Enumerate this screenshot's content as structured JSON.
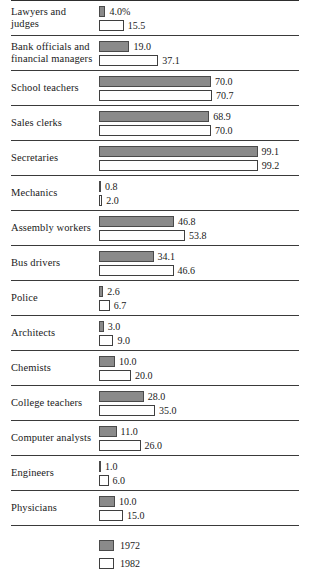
{
  "chart_data": {
    "type": "bar",
    "orientation": "horizontal",
    "title": "",
    "xlabel": "",
    "ylabel": "",
    "xlim": [
      0,
      100
    ],
    "grid": false,
    "legend_position": "bottom",
    "value_suffix_first": "%",
    "categories": [
      "Lawyers and judges",
      "Bank officials and financial managers",
      "School teachers",
      "Sales clerks",
      "Secretaries",
      "Mechanics",
      "Assembly workers",
      "Bus drivers",
      "Police",
      "Architects",
      "Chemists",
      "College teachers",
      "Computer analysts",
      "Engineers",
      "Physicians"
    ],
    "series": [
      {
        "name": "1972",
        "color": "#8a8a8a",
        "values": [
          4.0,
          19.0,
          70.0,
          68.9,
          99.1,
          0.8,
          46.8,
          34.1,
          2.6,
          3.0,
          10.0,
          28.0,
          11.0,
          1.0,
          10.0
        ],
        "labels": [
          "4.0%",
          "19.0",
          "70.0",
          "68.9",
          "99.1",
          "0.8",
          "46.8",
          "34.1",
          "2.6",
          "3.0",
          "10.0",
          "28.0",
          "11.0",
          "1.0",
          "10.0"
        ]
      },
      {
        "name": "1982",
        "color": "#ffffff",
        "values": [
          15.5,
          37.1,
          70.7,
          70.0,
          99.2,
          2.0,
          53.8,
          46.6,
          6.7,
          9.0,
          20.0,
          35.0,
          26.0,
          6.0,
          15.0
        ],
        "labels": [
          "15.5",
          "37.1",
          "70.7",
          "70.0",
          "99.2",
          "2.0",
          "53.8",
          "46.6",
          "6.7",
          "9.0",
          "20.0",
          "35.0",
          "26.0",
          "6.0",
          "15.0"
        ]
      }
    ]
  },
  "rows": [
    {
      "label": "Lawyers and judges",
      "v1972": 4.0,
      "l1972": "4.0%",
      "v1982": 15.5,
      "l1982": "15.5"
    },
    {
      "label": "Bank officials and financial managers",
      "v1972": 19.0,
      "l1972": "19.0",
      "v1982": 37.1,
      "l1982": "37.1"
    },
    {
      "label": "School teachers",
      "v1972": 70.0,
      "l1972": "70.0",
      "v1982": 70.7,
      "l1982": "70.7"
    },
    {
      "label": "Sales clerks",
      "v1972": 68.9,
      "l1972": "68.9",
      "v1982": 70.0,
      "l1982": "70.0"
    },
    {
      "label": "Secretaries",
      "v1972": 99.1,
      "l1972": "99.1",
      "v1982": 99.2,
      "l1982": "99.2"
    },
    {
      "label": "Mechanics",
      "v1972": 0.8,
      "l1972": "0.8",
      "v1982": 2.0,
      "l1982": "2.0"
    },
    {
      "label": "Assembly workers",
      "v1972": 46.8,
      "l1972": "46.8",
      "v1982": 53.8,
      "l1982": "53.8"
    },
    {
      "label": "Bus drivers",
      "v1972": 34.1,
      "l1972": "34.1",
      "v1982": 46.6,
      "l1982": "46.6"
    },
    {
      "label": "Police",
      "v1972": 2.6,
      "l1972": "2.6",
      "v1982": 6.7,
      "l1982": "6.7"
    },
    {
      "label": "Architects",
      "v1972": 3.0,
      "l1972": "3.0",
      "v1982": 9.0,
      "l1982": "9.0"
    },
    {
      "label": "Chemists",
      "v1972": 10.0,
      "l1972": "10.0",
      "v1982": 20.0,
      "l1982": "20.0"
    },
    {
      "label": "College teachers",
      "v1972": 28.0,
      "l1972": "28.0",
      "v1982": 35.0,
      "l1982": "35.0"
    },
    {
      "label": "Computer analysts",
      "v1972": 11.0,
      "l1972": "11.0",
      "v1982": 26.0,
      "l1982": "26.0"
    },
    {
      "label": "Engineers",
      "v1972": 1.0,
      "l1972": "1.0",
      "v1982": 6.0,
      "l1982": "6.0"
    },
    {
      "label": "Physicians",
      "v1972": 10.0,
      "l1972": "10.0",
      "v1982": 15.0,
      "l1982": "15.0"
    }
  ],
  "legend": {
    "items": [
      {
        "label": "1972",
        "key": "series-1972"
      },
      {
        "label": "1982",
        "key": "series-1982"
      }
    ]
  },
  "scale": {
    "px_per_unit": 1.6,
    "max_value": 100
  }
}
